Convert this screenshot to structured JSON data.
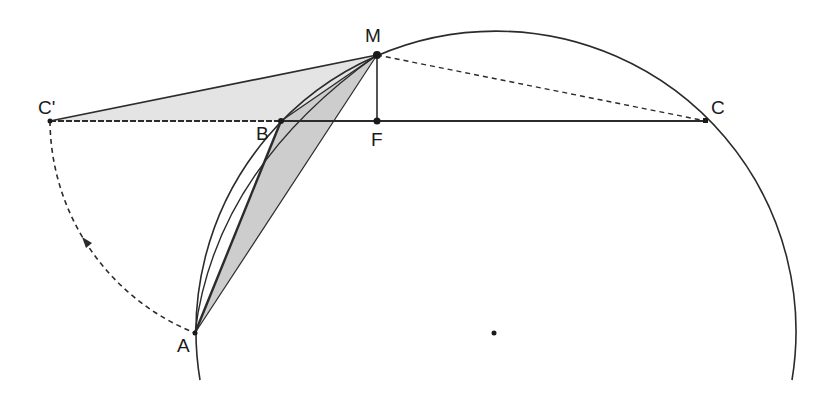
{
  "diagram": {
    "points": {
      "M": {
        "label": "M",
        "x": 377,
        "y": 55
      },
      "F": {
        "label": "F",
        "x": 377,
        "y": 121
      },
      "B": {
        "label": "B",
        "x": 281,
        "y": 121
      },
      "C": {
        "label": "C",
        "x": 706,
        "y": 121
      },
      "C_prime": {
        "label": "C'",
        "x": 50,
        "y": 121
      },
      "A": {
        "label": "A",
        "x": 195,
        "y": 333
      },
      "O": {
        "label": "",
        "x": 494,
        "y": 333
      }
    },
    "circle": {
      "center": "O",
      "radius": 300
    },
    "colors": {
      "stroke": "#2b2b2b",
      "fill_light": "#e3e3e3",
      "fill_dark": "#cfcfcf"
    }
  }
}
